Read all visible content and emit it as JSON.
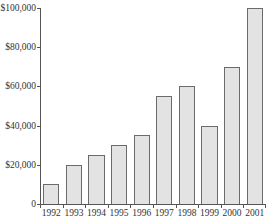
{
  "chart_data": {
    "type": "bar",
    "title": "",
    "xlabel": "",
    "ylabel": "",
    "categories": [
      "1992",
      "1993",
      "1994",
      "1995",
      "1996",
      "1997",
      "1998",
      "1999",
      "2000",
      "2001"
    ],
    "values": [
      10000,
      20000,
      25000,
      30000,
      35000,
      55000,
      60000,
      40000,
      70000,
      100000
    ],
    "ylim": [
      0,
      100000
    ],
    "yticks": [
      0,
      20000,
      40000,
      60000,
      80000,
      100000
    ],
    "ytick_labels": [
      "0",
      "$20,000",
      "$40,000",
      "$60,000",
      "$80,000",
      "$100,000"
    ],
    "grid": false,
    "legend": null,
    "bar_color": "#e3e3e3",
    "bar_edge_color": "#6b6b6b"
  }
}
